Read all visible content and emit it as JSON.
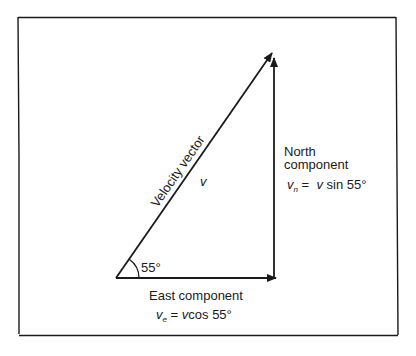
{
  "diagram": {
    "angle_label": "55°",
    "velocity": {
      "label": "Velocity vector",
      "symbol": "v"
    },
    "north": {
      "label_line1": "North",
      "label_line2": "component",
      "formula_var": "v",
      "formula_sub": "n",
      "formula_rest_var": "v",
      "formula_rest": "sin 55°",
      "equals": "="
    },
    "east": {
      "label": "East component",
      "formula_var": "v",
      "formula_sub": "e",
      "formula_rest_var": "v",
      "formula_rest": "cos 55°",
      "equals": "="
    },
    "colors": {
      "line": "#1a1a1a",
      "background": "#ffffff"
    }
  }
}
